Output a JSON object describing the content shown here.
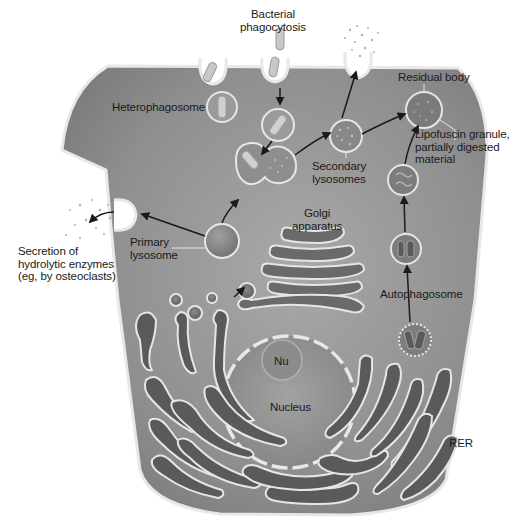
{
  "diagram": {
    "colors": {
      "cytoplasm": "#8a8a8a",
      "cytoplasm_light": "#a8a8a8",
      "membrane": "#e6e6e6",
      "organelle_dark": "#5e5e5e",
      "nucleus": "#9a9a9a",
      "arrow": "#1a1a1a",
      "background": "#ffffff"
    },
    "labels": {
      "bacterial_phagocytosis": "Bacterial\nphagocytosis",
      "heterophagosome": "Heterophagosome",
      "residual_body": "Residual body",
      "lipofuscin": "Lipofuscin granule,\npartially digested\nmaterial",
      "secondary_lysosomes": "Secondary\nlysosomes",
      "primary_lysosome": "Primary\nlysosome",
      "secretion": "Secretion of\nhydrolytic enzymes\n(eg, by osteoclasts)",
      "golgi": "Golgi\napparatus",
      "autophagosome": "Autophagosome",
      "nucleolus": "Nu",
      "nucleus": "Nucleus",
      "rer": "RER"
    }
  }
}
